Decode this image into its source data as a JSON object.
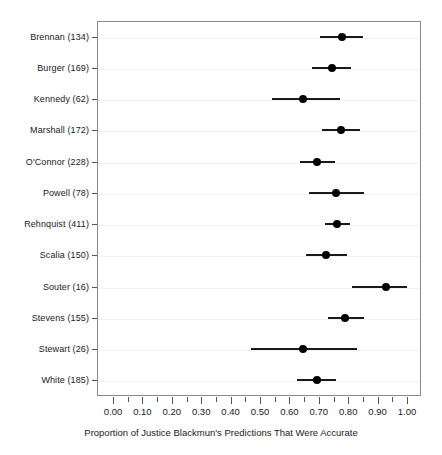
{
  "chart_data": {
    "type": "scatter",
    "subtype": "forest-plot",
    "title": "",
    "xlabel": "Proportion of Justice Blackmun's  Predictions That Were Accurate",
    "ylabel": "",
    "xlim": [
      0.0,
      1.0
    ],
    "xticks": [
      0.0,
      0.05,
      0.1,
      0.15,
      0.2,
      0.25,
      0.3,
      0.35,
      0.4,
      0.45,
      0.5,
      0.55,
      0.6,
      0.65,
      0.7,
      0.75,
      0.8,
      0.85,
      0.9,
      0.95,
      1.0
    ],
    "xticklabels_major": [
      "0.00",
      "0.10",
      "0.20",
      "0.30",
      "0.40",
      "0.50",
      "0.60",
      "0.70",
      "0.80",
      "0.90",
      "1.00"
    ],
    "xtick_major_values": [
      0.0,
      0.1,
      0.2,
      0.3,
      0.4,
      0.5,
      0.6,
      0.7,
      0.8,
      0.9,
      1.0
    ],
    "grid": true,
    "grid_axis": "y",
    "legend": null,
    "point_color": "#000000",
    "line_color": "#1a1a1a",
    "grid_color": "#f2f2f2",
    "frame_color": "#8a8a8a",
    "categories": [
      "Brennan (134)",
      "Burger (169)",
      "Kennedy (62)",
      "Marshall (172)",
      "O'Connor (228)",
      "Powell (78)",
      "Rehnquist (411)",
      "Scalia (150)",
      "Souter (16)",
      "Stevens (155)",
      "Stewart (26)",
      "White (185)"
    ],
    "points": [
      {
        "label": "Brennan (134)",
        "justice": "Brennan",
        "n": 134,
        "estimate": 0.78,
        "ci_low": 0.705,
        "ci_high": 0.85
      },
      {
        "label": "Burger (169)",
        "justice": "Burger",
        "n": 169,
        "estimate": 0.745,
        "ci_low": 0.678,
        "ci_high": 0.81
      },
      {
        "label": "Kennedy (62)",
        "justice": "Kennedy",
        "n": 62,
        "estimate": 0.645,
        "ci_low": 0.54,
        "ci_high": 0.772
      },
      {
        "label": "Marshall (172)",
        "justice": "Marshall",
        "n": 172,
        "estimate": 0.775,
        "ci_low": 0.712,
        "ci_high": 0.84
      },
      {
        "label": "O'Connor (228)",
        "justice": "O'Connor",
        "n": 228,
        "estimate": 0.695,
        "ci_low": 0.635,
        "ci_high": 0.755
      },
      {
        "label": "Powell (78)",
        "justice": "Powell",
        "n": 78,
        "estimate": 0.76,
        "ci_low": 0.668,
        "ci_high": 0.855
      },
      {
        "label": "Rehnquist (411)",
        "justice": "Rehnquist",
        "n": 411,
        "estimate": 0.762,
        "ci_low": 0.722,
        "ci_high": 0.805
      },
      {
        "label": "Scalia (150)",
        "justice": "Scalia",
        "n": 150,
        "estimate": 0.725,
        "ci_low": 0.655,
        "ci_high": 0.795
      },
      {
        "label": "Souter (16)",
        "justice": "Souter",
        "n": 16,
        "estimate": 0.93,
        "ci_low": 0.812,
        "ci_high": 1.0
      },
      {
        "label": "Stevens (155)",
        "justice": "Stevens",
        "n": 155,
        "estimate": 0.79,
        "ci_low": 0.73,
        "ci_high": 0.855
      },
      {
        "label": "Stewart (26)",
        "justice": "Stewart",
        "n": 26,
        "estimate": 0.645,
        "ci_low": 0.468,
        "ci_high": 0.83
      },
      {
        "label": "White (185)",
        "justice": "White",
        "n": 185,
        "estimate": 0.695,
        "ci_low": 0.625,
        "ci_high": 0.76
      }
    ]
  }
}
